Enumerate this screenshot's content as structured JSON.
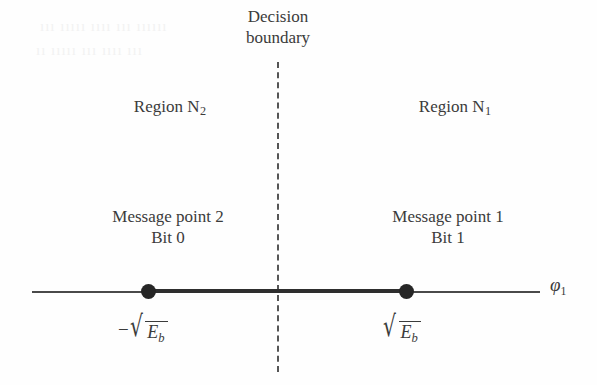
{
  "figure": {
    "type": "bpsk-signal-space-diagram",
    "background_color": "#fefefe",
    "ink_color": "#3b3b3b"
  },
  "decision_boundary": {
    "line1": "Decision",
    "line2": "boundary",
    "line_style": "dashed",
    "line_color": "#555555"
  },
  "regions": {
    "left": {
      "name": "Region N",
      "subscript": "2"
    },
    "right": {
      "name": "Region N",
      "subscript": "1"
    }
  },
  "message_points": {
    "left": {
      "line1": "Message point 2",
      "line2": "Bit 0"
    },
    "right": {
      "line1": "Message point 1",
      "line2": "Bit 1"
    }
  },
  "axis": {
    "name": "φ",
    "name_subscript": "1",
    "ticks": {
      "left": {
        "sign": "−",
        "radical": "√",
        "radicand": "E",
        "radicand_subscript": "b"
      },
      "right": {
        "sign": "",
        "radical": "√",
        "radicand": "E",
        "radicand_subscript": "b"
      }
    },
    "dot_color": "#262626"
  },
  "bleed_through": {
    "row1": "ııı ııııı ıııı ııı ıııııı",
    "row2": "ıı ııııı ııı ıııı ııı"
  }
}
